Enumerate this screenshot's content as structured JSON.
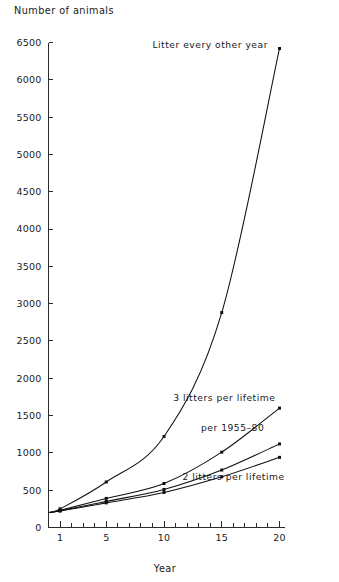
{
  "chart_data": {
    "type": "line",
    "title": "",
    "ylabel": "Number of animals",
    "xlabel": "Year",
    "xlim": [
      0,
      20.5
    ],
    "ylim": [
      0,
      6500
    ],
    "grid": false,
    "legend_position": "inline-annotations",
    "y_ticks": [
      0,
      500,
      1000,
      1500,
      2000,
      2500,
      3000,
      3500,
      4000,
      4500,
      5000,
      5500,
      6000,
      6500
    ],
    "y_tick_labels": [
      "0",
      "500",
      "1000",
      "1500",
      "2000",
      "2500",
      "3000",
      "3500",
      "4000",
      "4500",
      "5000",
      "5500",
      "6000",
      "6500"
    ],
    "x_ticks_minor": [
      1,
      2,
      3,
      4,
      5,
      6,
      7,
      8,
      9,
      10,
      11,
      12,
      13,
      14,
      15,
      16,
      17,
      18,
      19,
      20
    ],
    "x_ticks_labeled": [
      1,
      5,
      10,
      15,
      20
    ],
    "x_tick_labels": [
      "1",
      "5",
      "10",
      "15",
      "20"
    ],
    "series": [
      {
        "name": "Litter every other year",
        "label": "Litter every other year",
        "label_x": 9.0,
        "label_y": 6420,
        "markers": [
          1,
          5,
          10,
          15,
          20
        ],
        "x": [
          0,
          1,
          5,
          10,
          15,
          20
        ],
        "values": [
          200,
          250,
          610,
          1220,
          2880,
          6420
        ]
      },
      {
        "name": "3 litters per lifetime",
        "label": "3 litters per lifetime",
        "label_x": 10.8,
        "label_y": 1690,
        "markers": [
          1,
          5,
          10,
          15,
          20
        ],
        "x": [
          0,
          1,
          5,
          10,
          15,
          20
        ],
        "values": [
          200,
          230,
          390,
          590,
          1010,
          1600
        ]
      },
      {
        "name": "per 1955-80",
        "label": "per 1955–80",
        "label_x": 13.2,
        "label_y": 1300,
        "markers": [
          1,
          5,
          10,
          15,
          20
        ],
        "x": [
          0,
          1,
          5,
          10,
          15,
          20
        ],
        "values": [
          200,
          225,
          350,
          510,
          770,
          1120
        ]
      },
      {
        "name": "2 litters per lifetime",
        "label": "2 litters per lifetime",
        "label_x": 11.6,
        "label_y": 640,
        "markers": [
          1,
          5,
          10,
          15,
          20
        ],
        "x": [
          0,
          1,
          5,
          10,
          15,
          20
        ],
        "values": [
          200,
          220,
          330,
          470,
          680,
          940
        ]
      }
    ]
  }
}
